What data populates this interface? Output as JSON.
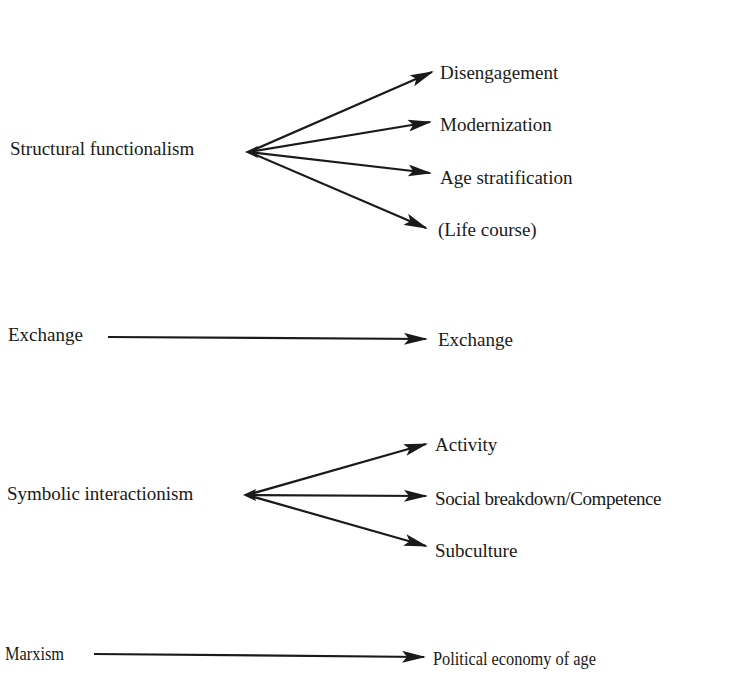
{
  "diagram": {
    "type": "theory-mapping",
    "arrow_color": "#1a1a1a",
    "groups": [
      {
        "source": "Structural functionalism",
        "targets": [
          "Disengagement",
          "Modernization",
          "Age stratification",
          "(Life course)"
        ]
      },
      {
        "source": "Exchange",
        "targets": [
          "Exchange"
        ]
      },
      {
        "source": "Symbolic interactionism",
        "targets": [
          "Activity",
          "Social breakdown/Competence",
          "Subculture"
        ]
      },
      {
        "source": "Marxism",
        "targets": [
          "Political economy of age"
        ]
      }
    ]
  }
}
